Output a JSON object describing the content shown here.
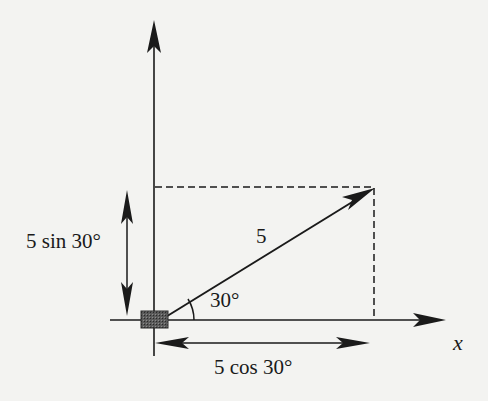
{
  "diagram": {
    "type": "vector-components",
    "vector": {
      "magnitude_label": "5",
      "angle_label": "30°",
      "magnitude": 5,
      "angle_deg": 30
    },
    "components": {
      "vertical_label": "5 sin 30°",
      "horizontal_label": "5 cos 30°"
    },
    "axes": {
      "x_label": "x"
    },
    "colors": {
      "ink": "#1a1a1a",
      "paper": "#f3f3f1",
      "block": "#4a4a4a"
    }
  }
}
